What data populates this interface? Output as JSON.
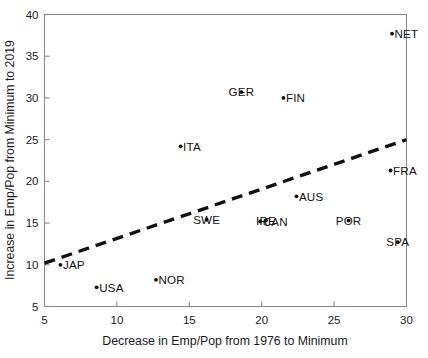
{
  "chart_data": {
    "type": "scatter",
    "title": "",
    "xlabel": "Decrease in Emp/Pop from 1976 to Minimum",
    "ylabel": "Increase in Emp/Pop from Minimum to 2019",
    "xlim": [
      5,
      30
    ],
    "ylim": [
      5,
      40
    ],
    "xticks": [
      5,
      10,
      15,
      20,
      25,
      30
    ],
    "yticks": [
      5,
      10,
      15,
      20,
      25,
      30,
      35,
      40
    ],
    "grid": false,
    "legend": null,
    "points": [
      {
        "label": "NET",
        "x": 29.0,
        "y": 37.7,
        "label_side": "right"
      },
      {
        "label": "GER",
        "x": 18.6,
        "y": 30.7,
        "label_side": "center"
      },
      {
        "label": "FIN",
        "x": 21.5,
        "y": 30.0,
        "label_side": "right"
      },
      {
        "label": "ITA",
        "x": 14.4,
        "y": 24.2,
        "label_side": "right"
      },
      {
        "label": "FRA",
        "x": 28.9,
        "y": 21.3,
        "label_side": "right"
      },
      {
        "label": "AUS",
        "x": 22.4,
        "y": 18.2,
        "label_side": "right"
      },
      {
        "label": "SWE",
        "x": 16.2,
        "y": 15.4,
        "label_side": "center"
      },
      {
        "label": "CAN",
        "x": 19.9,
        "y": 15.2,
        "label_side": "right"
      },
      {
        "label": "IRE",
        "x": 20.3,
        "y": 15.3,
        "label_side": "center"
      },
      {
        "label": "POR",
        "x": 26.0,
        "y": 15.3,
        "label_side": "center"
      },
      {
        "label": "SPA",
        "x": 29.4,
        "y": 12.7,
        "label_side": "center"
      },
      {
        "label": "JAP",
        "x": 6.1,
        "y": 10.0,
        "label_side": "right"
      },
      {
        "label": "NOR",
        "x": 12.7,
        "y": 8.2,
        "label_side": "right"
      },
      {
        "label": "USA",
        "x": 8.6,
        "y": 7.3,
        "label_side": "right"
      }
    ],
    "trendline": {
      "style": "dashed",
      "x": [
        5,
        30
      ],
      "y": [
        10.2,
        25.0
      ]
    }
  }
}
